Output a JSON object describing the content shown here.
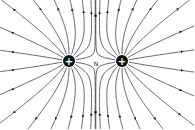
{
  "diagram": {
    "charges": [
      {
        "sign": "+",
        "x": 69,
        "y": 61,
        "label": "+"
      },
      {
        "sign": "+",
        "x": 122,
        "y": 61,
        "label": "+"
      }
    ],
    "neutral_point": {
      "x": 96,
      "y": 63,
      "label": "N"
    },
    "colors": {
      "line": "#222222",
      "charge_fill": "#111111",
      "charge_symbol": "#ffffff",
      "background": "#ffffff"
    }
  }
}
